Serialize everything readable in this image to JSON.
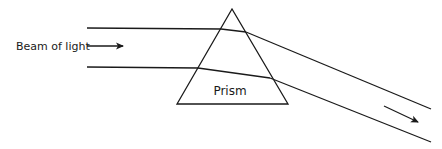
{
  "diagram": {
    "labels": {
      "beam": "Beam of light",
      "prism": "Prism"
    },
    "colors": {
      "stroke": "#1a1a1a",
      "background": "#ffffff"
    },
    "elements": [
      {
        "id": "prism",
        "type": "triangle",
        "label": "Prism"
      },
      {
        "id": "incident-beam-top",
        "type": "ray"
      },
      {
        "id": "incident-beam-bottom",
        "type": "ray"
      },
      {
        "id": "refracted-beam-top",
        "type": "ray"
      },
      {
        "id": "refracted-beam-bottom",
        "type": "ray"
      },
      {
        "id": "emergent-beam-top",
        "type": "ray"
      },
      {
        "id": "emergent-beam-bottom",
        "type": "ray"
      },
      {
        "id": "incident-direction-arrow",
        "type": "arrow"
      },
      {
        "id": "emergent-direction-arrow",
        "type": "arrow"
      }
    ]
  }
}
